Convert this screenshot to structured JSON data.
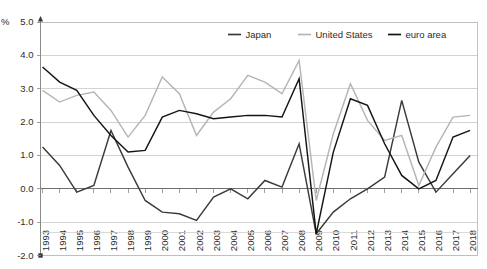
{
  "chart_data": {
    "type": "line",
    "title": "",
    "subtitle": "",
    "unit_label": "%",
    "xlabel": "",
    "ylabel": "",
    "ylim": [
      -2.0,
      5.0
    ],
    "ytick_step": 1.0,
    "yticks": [
      "5.0",
      "4.0",
      "3.0",
      "2.0",
      "1.0",
      "0.0",
      "-1.0",
      "-2.0"
    ],
    "ytick_values": [
      5.0,
      4.0,
      3.0,
      2.0,
      1.0,
      0.0,
      -1.0,
      -2.0
    ],
    "grid": true,
    "legend_position": "top-right",
    "categories": [
      "1993",
      "1994",
      "1995",
      "1996",
      "1997",
      "1998",
      "1999",
      "2000",
      "2001",
      "2002",
      "2003",
      "2004",
      "2005",
      "2006",
      "2007",
      "2008",
      "2009",
      "2010",
      "2011",
      "2012",
      "2013",
      "2014",
      "2015",
      "2016",
      "2017",
      "2018"
    ],
    "series": [
      {
        "name": "Japan",
        "color": "#3a3a3a",
        "values": [
          1.25,
          0.7,
          -0.1,
          0.1,
          1.75,
          0.65,
          -0.35,
          -0.7,
          -0.75,
          -0.95,
          -0.25,
          0.0,
          -0.3,
          0.25,
          0.05,
          1.35,
          -1.35,
          -0.7,
          -0.3,
          0.0,
          0.35,
          2.65,
          0.8,
          -0.1,
          0.45,
          1.0
        ]
      },
      {
        "name": "United States",
        "color": "#b5b5b5",
        "values": [
          2.95,
          2.6,
          2.8,
          2.9,
          2.35,
          1.55,
          2.2,
          3.35,
          2.85,
          1.6,
          2.3,
          2.7,
          3.4,
          3.2,
          2.85,
          3.85,
          -0.35,
          1.65,
          3.15,
          2.05,
          1.45,
          1.6,
          0.1,
          1.25,
          2.15,
          2.2
        ]
      },
      {
        "name": "euro area",
        "color": "#141414",
        "values": [
          3.65,
          3.2,
          2.95,
          2.2,
          1.6,
          1.1,
          1.15,
          2.15,
          2.35,
          2.25,
          2.1,
          2.15,
          2.2,
          2.2,
          2.15,
          3.3,
          -1.35,
          1.1,
          2.7,
          2.5,
          1.35,
          0.4,
          0.0,
          0.25,
          1.55,
          1.75
        ]
      }
    ],
    "legend": [
      {
        "label": "Japan",
        "color": "#3a3a3a"
      },
      {
        "label": "United States",
        "color": "#b5b5b5"
      },
      {
        "label": "euro area",
        "color": "#141414"
      }
    ]
  }
}
